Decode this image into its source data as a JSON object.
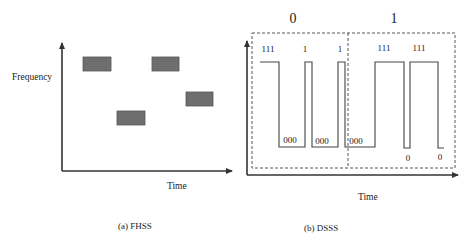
{
  "fhss": {
    "ylabel": "Frequency",
    "xlabel": "Time",
    "caption": "(a) FHSS",
    "axis": {
      "x0": 62,
      "y0": 171,
      "xEnd": 232,
      "yTop": 43
    },
    "hops": [
      {
        "x": 83,
        "y": 57,
        "w": 28,
        "h": 14
      },
      {
        "x": 117,
        "y": 111,
        "w": 28,
        "h": 14
      },
      {
        "x": 152,
        "y": 57,
        "w": 27,
        "h": 14
      },
      {
        "x": 186,
        "y": 92,
        "w": 27,
        "h": 14
      }
    ],
    "colors": {
      "box_fill": "#6e6e6e",
      "axis": "#333333"
    }
  },
  "dsss": {
    "xlabel": "Time",
    "caption": "(b) DSSS",
    "data_bits": [
      "0",
      "1"
    ],
    "axis": {
      "x0": 247,
      "y0": 175,
      "xEnd": 458,
      "yTop": 41
    },
    "frame": {
      "x": 252,
      "y": 33,
      "w": 203,
      "h": 135,
      "divider_x": 348
    },
    "levels": {
      "high": 62,
      "low": 147
    },
    "waveform_points": [
      [
        260,
        62
      ],
      [
        279,
        62
      ],
      [
        279,
        147
      ],
      [
        305,
        147
      ],
      [
        305,
        62
      ],
      [
        312,
        62
      ],
      [
        312,
        147
      ],
      [
        338,
        147
      ],
      [
        338,
        62
      ],
      [
        345,
        62
      ],
      [
        345,
        147
      ],
      [
        375,
        147
      ],
      [
        375,
        62
      ],
      [
        404,
        62
      ],
      [
        404,
        148
      ],
      [
        410,
        148
      ],
      [
        410,
        62
      ],
      [
        438,
        62
      ],
      [
        438,
        148
      ],
      [
        444,
        148
      ]
    ],
    "chip_labels": [
      {
        "text": "111",
        "x": 268,
        "y": 52
      },
      {
        "text": "1",
        "x": 305,
        "y": 52
      },
      {
        "text": "1",
        "x": 340,
        "y": 52
      },
      {
        "text": "000",
        "x": 290,
        "y": 143
      },
      {
        "text": "000",
        "x": 322,
        "y": 144
      },
      {
        "text": "000",
        "x": 356,
        "y": 144
      },
      {
        "text": "111",
        "x": 384,
        "y": 51
      },
      {
        "text": "111",
        "x": 419,
        "y": 51
      },
      {
        "text": "0",
        "x": 408,
        "y": 161
      },
      {
        "text": "0",
        "x": 440,
        "y": 160
      }
    ],
    "bit_label_positions": [
      {
        "x": 293,
        "y": 23
      },
      {
        "x": 394,
        "y": 23
      }
    ],
    "colors": {
      "waveform": "#444444",
      "frame": "#444444"
    }
  }
}
